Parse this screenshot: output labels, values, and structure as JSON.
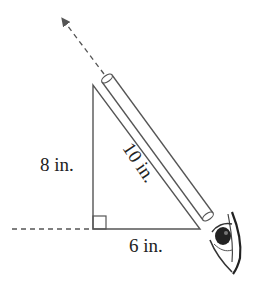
{
  "diagram": {
    "type": "right-triangle-with-sighting-tube",
    "labels": {
      "vertical_side": "8 in.",
      "hypotenuse": "10 in.",
      "base": "6 in."
    },
    "elements": [
      "right-triangle",
      "right-angle-marker",
      "sighting-tube",
      "dashed-line-of-sight-arrow",
      "dashed-horizontal-extension",
      "eye"
    ],
    "colors": {
      "stroke": "#555555",
      "text": "#222222",
      "background": "#ffffff"
    }
  }
}
